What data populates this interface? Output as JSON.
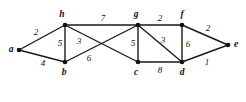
{
  "figure": {
    "background_color": "#ffffff",
    "line_color": "#1a1a1a",
    "label_color": "#111111"
  },
  "chart_data": {
    "type": "diagram",
    "subtype": "weighted-undirected-graph",
    "title": "",
    "xlabel": "",
    "ylabel": "",
    "grid": false,
    "legend": null,
    "nodes": [
      {
        "id": "a",
        "label": "a",
        "x": 19,
        "y": 50,
        "label_x": 11,
        "label_y": 50
      },
      {
        "id": "h",
        "label": "h",
        "x": 65,
        "y": 25,
        "label_x": 62,
        "label_y": 15
      },
      {
        "id": "b",
        "label": "b",
        "x": 65,
        "y": 62,
        "label_x": 64,
        "label_y": 73
      },
      {
        "id": "g",
        "label": "g",
        "x": 138,
        "y": 25,
        "label_x": 136,
        "label_y": 15
      },
      {
        "id": "c",
        "label": "c",
        "x": 138,
        "y": 62,
        "label_x": 136,
        "label_y": 73
      },
      {
        "id": "d",
        "label": "d",
        "x": 182,
        "y": 62,
        "label_x": 182,
        "label_y": 73
      },
      {
        "id": "f",
        "label": "f",
        "x": 182,
        "y": 25,
        "label_x": 182,
        "label_y": 15
      },
      {
        "id": "e",
        "label": "e",
        "x": 228,
        "y": 45,
        "label_x": 236,
        "label_y": 45
      }
    ],
    "edges": [
      {
        "source": "a",
        "target": "h",
        "weight": 2,
        "label": "2",
        "label_x": 36,
        "label_y": 32
      },
      {
        "source": "a",
        "target": "b",
        "weight": 4,
        "label": "4",
        "label_x": 43,
        "label_y": 63
      },
      {
        "source": "h",
        "target": "b",
        "weight": 5,
        "label": "5",
        "label_x": 60,
        "label_y": 43
      },
      {
        "source": "h",
        "target": "g",
        "weight": 7,
        "label": "7",
        "label_x": 103,
        "label_y": 18
      },
      {
        "source": "h",
        "target": "c",
        "weight": 3,
        "label": "3",
        "label_x": 79,
        "label_y": 41
      },
      {
        "source": "b",
        "target": "g",
        "weight": 6,
        "label": "6",
        "label_x": 89,
        "label_y": 58
      },
      {
        "source": "g",
        "target": "c",
        "weight": 5,
        "label": "5",
        "label_x": 133,
        "label_y": 43
      },
      {
        "source": "g",
        "target": "d",
        "weight": 3,
        "label": "3",
        "label_x": 163,
        "label_y": 40
      },
      {
        "source": "c",
        "target": "d",
        "weight": 8,
        "label": "8",
        "label_x": 160,
        "label_y": 70
      },
      {
        "source": "g",
        "target": "f",
        "weight": 2,
        "label": "2",
        "label_x": 160,
        "label_y": 18
      },
      {
        "source": "f",
        "target": "d",
        "weight": 6,
        "label": "6",
        "label_x": 188,
        "label_y": 44
      },
      {
        "source": "f",
        "target": "e",
        "weight": 2,
        "label": "2",
        "label_x": 208,
        "label_y": 28
      },
      {
        "source": "d",
        "target": "e",
        "weight": 1,
        "label": "1",
        "label_x": 207,
        "label_y": 62
      }
    ]
  }
}
